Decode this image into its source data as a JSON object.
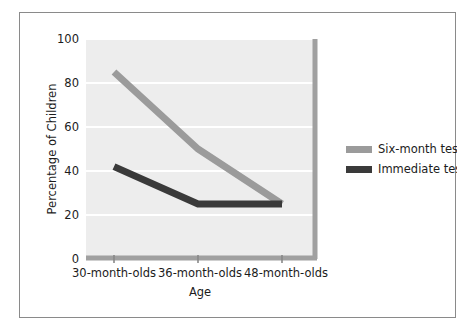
{
  "figure": {
    "background_color": "#ffffff",
    "frame_color": "#8a8a8a",
    "plot_background_color": "#ededed",
    "gridline_color": "#ffffff",
    "axis_color": "#999999"
  },
  "chart_data": {
    "type": "line",
    "title": "",
    "subtitle": "",
    "xlabel": "Age",
    "ylabel": "Percentage of Children",
    "categories": [
      "30-month-olds",
      "36-month-olds",
      "48-month-olds"
    ],
    "ylim": [
      0,
      100
    ],
    "yticks": [
      "0",
      "20",
      "40",
      "60",
      "80",
      "100"
    ],
    "ytick_values": [
      0,
      20,
      40,
      60,
      80,
      100
    ],
    "grid": "horizontal",
    "legend_position": "right",
    "series": [
      {
        "name": "Six-month test",
        "color": "#9b9b9b",
        "values": [
          85,
          50,
          25
        ]
      },
      {
        "name": "Immediate test",
        "color": "#3a3a3a",
        "values": [
          42,
          25,
          25
        ]
      }
    ]
  },
  "legend": {
    "entries": [
      {
        "label": "Six-month test",
        "color": "#9b9b9b"
      },
      {
        "label": "Immediate test",
        "color": "#3a3a3a"
      }
    ]
  }
}
